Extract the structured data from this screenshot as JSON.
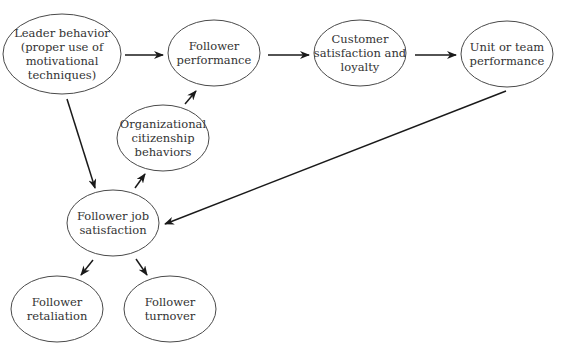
{
  "diagram": {
    "type": "flow",
    "nodes": [
      {
        "id": "leader",
        "lines": [
          "Leader behavior",
          "(proper use of",
          "motivational",
          "techniques)"
        ],
        "cx": 62,
        "cy": 54,
        "rx": 59,
        "ry": 40
      },
      {
        "id": "performance",
        "lines": [
          "Follower",
          "performance"
        ],
        "cx": 214,
        "cy": 53,
        "rx": 46,
        "ry": 33
      },
      {
        "id": "customer",
        "lines": [
          "Customer",
          "satisfaction and",
          "loyalty"
        ],
        "cx": 360,
        "cy": 53,
        "rx": 46,
        "ry": 33
      },
      {
        "id": "unit",
        "lines": [
          "Unit or team",
          "performance"
        ],
        "cx": 507,
        "cy": 54,
        "rx": 46,
        "ry": 33
      },
      {
        "id": "ocb",
        "lines": [
          "Organizational",
          "citizenship",
          "behaviors"
        ],
        "cx": 163,
        "cy": 138,
        "rx": 46,
        "ry": 33
      },
      {
        "id": "jobsat",
        "lines": [
          "Follower job",
          "satisfaction"
        ],
        "cx": 113,
        "cy": 223,
        "rx": 46,
        "ry": 33
      },
      {
        "id": "retaliation",
        "lines": [
          "Follower",
          "retaliation"
        ],
        "cx": 57,
        "cy": 309,
        "rx": 46,
        "ry": 33
      },
      {
        "id": "turnover",
        "lines": [
          "Follower",
          "turnover"
        ],
        "cx": 170,
        "cy": 309,
        "rx": 46,
        "ry": 33
      }
    ],
    "edges": [
      {
        "from": "leader",
        "to": "performance",
        "x1": 125,
        "y1": 55,
        "x2": 163,
        "y2": 55
      },
      {
        "from": "performance",
        "to": "customer",
        "x1": 268,
        "y1": 55,
        "x2": 309,
        "y2": 55
      },
      {
        "from": "customer",
        "to": "unit",
        "x1": 415,
        "y1": 55,
        "x2": 456,
        "y2": 55
      },
      {
        "from": "leader",
        "to": "jobsat",
        "x1": 67,
        "y1": 99,
        "x2": 95,
        "y2": 188
      },
      {
        "from": "ocb",
        "to": "performance",
        "x1": 185,
        "y1": 104,
        "x2": 196,
        "y2": 91
      },
      {
        "from": "jobsat",
        "to": "ocb",
        "x1": 135,
        "y1": 188,
        "x2": 145,
        "y2": 174
      },
      {
        "from": "unit",
        "to": "jobsat",
        "x1": 506,
        "y1": 91,
        "x2": 165,
        "y2": 224
      },
      {
        "from": "jobsat",
        "to": "retaliation",
        "x1": 93,
        "y1": 260,
        "x2": 81,
        "y2": 275
      },
      {
        "from": "jobsat",
        "to": "turnover",
        "x1": 136,
        "y1": 259,
        "x2": 147,
        "y2": 275
      }
    ]
  },
  "colors": {
    "stroke": "#4a4a4a",
    "arrow": "#1a1a1a",
    "text": "#333333",
    "background": "#ffffff"
  }
}
